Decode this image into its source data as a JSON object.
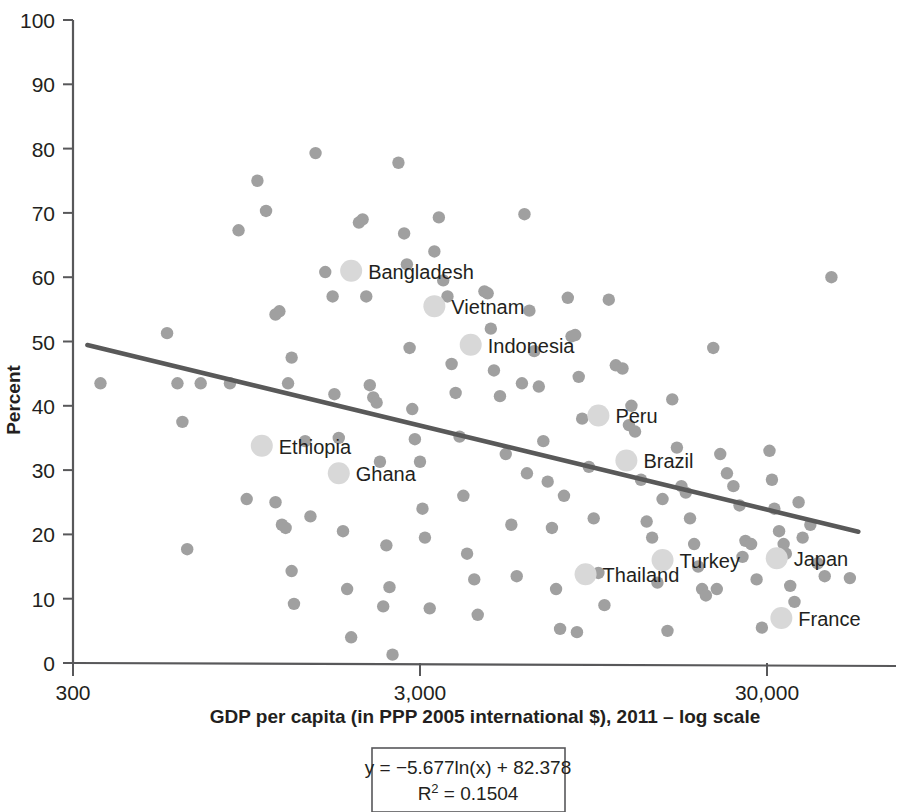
{
  "chart_data": {
    "type": "scatter",
    "title": "",
    "xlabel": "GDP per capita (in PPP 2005 international $), 2011 – log scale",
    "ylabel": "Percent",
    "x_scale": "log",
    "xlim": [
      300,
      60000
    ],
    "ylim": [
      0,
      100
    ],
    "x_ticks": [
      {
        "value": 300,
        "label": "300"
      },
      {
        "value": 3000,
        "label": "3,000"
      },
      {
        "value": 30000,
        "label": "30,000"
      }
    ],
    "y_ticks": [
      {
        "value": 0,
        "label": "0"
      },
      {
        "value": 10,
        "label": "10"
      },
      {
        "value": 20,
        "label": "20"
      },
      {
        "value": 30,
        "label": "30"
      },
      {
        "value": 40,
        "label": "40"
      },
      {
        "value": 50,
        "label": "50"
      },
      {
        "value": 60,
        "label": "60"
      },
      {
        "value": 70,
        "label": "70"
      },
      {
        "value": 80,
        "label": "80"
      },
      {
        "value": 90,
        "label": "90"
      },
      {
        "value": 100,
        "label": "100"
      }
    ],
    "grid": false,
    "legend": "none",
    "marker_color": "#a0a0a0",
    "highlight_marker_color": "#d8d8d8",
    "trendline_color": "#595959",
    "axis_color": "#58585a",
    "trendline": {
      "equation": "y = −5.677ln(x) + 82.378",
      "r_squared_label": "R² = 0.1504",
      "r_squared": 0.1504,
      "slope": -5.677,
      "intercept": 82.378,
      "x_start": 330,
      "x_end": 55000
    },
    "series": [
      {
        "name": "Countries (highlighted)",
        "points": [
          {
            "label": "Bangladesh",
            "x": 1900,
            "y": 61.0
          },
          {
            "label": "Vietnam",
            "x": 3300,
            "y": 55.5
          },
          {
            "label": "Indonesia",
            "x": 4200,
            "y": 49.5
          },
          {
            "label": "Peru",
            "x": 9800,
            "y": 38.5
          },
          {
            "label": "Brazil",
            "x": 11800,
            "y": 31.5
          },
          {
            "label": "Ethiopia",
            "x": 1050,
            "y": 33.8
          },
          {
            "label": "Ghana",
            "x": 1750,
            "y": 29.5
          },
          {
            "label": "Thailand",
            "x": 9000,
            "y": 13.8
          },
          {
            "label": "Turkey",
            "x": 15000,
            "y": 16.0
          },
          {
            "label": "Japan",
            "x": 32000,
            "y": 16.3
          },
          {
            "label": "France",
            "x": 33000,
            "y": 7.0
          }
        ]
      },
      {
        "name": "Other countries",
        "points": [
          {
            "x": 360,
            "y": 43.5
          },
          {
            "x": 560,
            "y": 51.3
          },
          {
            "x": 600,
            "y": 43.5
          },
          {
            "x": 620,
            "y": 37.5
          },
          {
            "x": 640,
            "y": 17.7
          },
          {
            "x": 900,
            "y": 67.3
          },
          {
            "x": 1020,
            "y": 75.0
          },
          {
            "x": 1080,
            "y": 70.3
          },
          {
            "x": 1150,
            "y": 54.2
          },
          {
            "x": 1180,
            "y": 54.7
          },
          {
            "x": 1250,
            "y": 43.5
          },
          {
            "x": 1280,
            "y": 47.5
          },
          {
            "x": 1150,
            "y": 25.0
          },
          {
            "x": 1200,
            "y": 21.5
          },
          {
            "x": 1230,
            "y": 21.0
          },
          {
            "x": 1280,
            "y": 14.3
          },
          {
            "x": 1300,
            "y": 9.2
          },
          {
            "x": 1500,
            "y": 79.3
          },
          {
            "x": 1600,
            "y": 60.8
          },
          {
            "x": 1680,
            "y": 57.0
          },
          {
            "x": 1700,
            "y": 41.8
          },
          {
            "x": 1750,
            "y": 35.0
          },
          {
            "x": 1800,
            "y": 20.5
          },
          {
            "x": 1850,
            "y": 11.5
          },
          {
            "x": 1900,
            "y": 4.0
          },
          {
            "x": 2000,
            "y": 68.5
          },
          {
            "x": 2050,
            "y": 69.0
          },
          {
            "x": 2100,
            "y": 57.0
          },
          {
            "x": 2150,
            "y": 43.2
          },
          {
            "x": 2200,
            "y": 41.3
          },
          {
            "x": 2250,
            "y": 40.5
          },
          {
            "x": 2300,
            "y": 31.3
          },
          {
            "x": 2400,
            "y": 18.3
          },
          {
            "x": 2450,
            "y": 11.8
          },
          {
            "x": 2500,
            "y": 1.3
          },
          {
            "x": 2600,
            "y": 77.8
          },
          {
            "x": 2700,
            "y": 66.8
          },
          {
            "x": 2750,
            "y": 62.0
          },
          {
            "x": 2800,
            "y": 49.0
          },
          {
            "x": 2850,
            "y": 39.5
          },
          {
            "x": 2900,
            "y": 34.8
          },
          {
            "x": 3000,
            "y": 31.3
          },
          {
            "x": 3050,
            "y": 24.0
          },
          {
            "x": 3100,
            "y": 19.5
          },
          {
            "x": 3200,
            "y": 8.5
          },
          {
            "x": 3400,
            "y": 69.3
          },
          {
            "x": 3500,
            "y": 59.5
          },
          {
            "x": 3600,
            "y": 57.0
          },
          {
            "x": 3700,
            "y": 46.5
          },
          {
            "x": 3800,
            "y": 42.0
          },
          {
            "x": 3900,
            "y": 35.2
          },
          {
            "x": 4000,
            "y": 26.0
          },
          {
            "x": 4100,
            "y": 17.0
          },
          {
            "x": 4300,
            "y": 13.0
          },
          {
            "x": 4400,
            "y": 7.5
          },
          {
            "x": 4600,
            "y": 57.8
          },
          {
            "x": 4700,
            "y": 57.5
          },
          {
            "x": 4800,
            "y": 52.0
          },
          {
            "x": 4900,
            "y": 45.5
          },
          {
            "x": 5100,
            "y": 41.5
          },
          {
            "x": 5300,
            "y": 32.5
          },
          {
            "x": 5500,
            "y": 21.5
          },
          {
            "x": 5700,
            "y": 13.5
          },
          {
            "x": 6000,
            "y": 69.8
          },
          {
            "x": 6200,
            "y": 54.8
          },
          {
            "x": 6400,
            "y": 48.5
          },
          {
            "x": 6600,
            "y": 43.0
          },
          {
            "x": 6800,
            "y": 34.5
          },
          {
            "x": 7000,
            "y": 28.2
          },
          {
            "x": 7200,
            "y": 21.0
          },
          {
            "x": 7400,
            "y": 11.5
          },
          {
            "x": 7600,
            "y": 5.3
          },
          {
            "x": 8000,
            "y": 56.8
          },
          {
            "x": 8200,
            "y": 50.8
          },
          {
            "x": 8400,
            "y": 51.0
          },
          {
            "x": 8600,
            "y": 44.5
          },
          {
            "x": 8800,
            "y": 38.0
          },
          {
            "x": 9200,
            "y": 30.5
          },
          {
            "x": 9500,
            "y": 22.5
          },
          {
            "x": 9800,
            "y": 14.0
          },
          {
            "x": 10200,
            "y": 9.0
          },
          {
            "x": 10500,
            "y": 56.5
          },
          {
            "x": 11000,
            "y": 46.3
          },
          {
            "x": 11500,
            "y": 45.8
          },
          {
            "x": 12000,
            "y": 37.0
          },
          {
            "x": 12500,
            "y": 36.0
          },
          {
            "x": 13000,
            "y": 28.5
          },
          {
            "x": 13500,
            "y": 22.0
          },
          {
            "x": 14000,
            "y": 19.5
          },
          {
            "x": 14500,
            "y": 12.5
          },
          {
            "x": 15500,
            "y": 5.0
          },
          {
            "x": 16000,
            "y": 41.0
          },
          {
            "x": 16500,
            "y": 33.5
          },
          {
            "x": 17000,
            "y": 27.5
          },
          {
            "x": 17500,
            "y": 26.5
          },
          {
            "x": 18000,
            "y": 22.5
          },
          {
            "x": 18500,
            "y": 18.5
          },
          {
            "x": 19000,
            "y": 15.0
          },
          {
            "x": 19500,
            "y": 11.5
          },
          {
            "x": 20000,
            "y": 10.5
          },
          {
            "x": 21000,
            "y": 49.0
          },
          {
            "x": 22000,
            "y": 32.5
          },
          {
            "x": 23000,
            "y": 29.5
          },
          {
            "x": 24000,
            "y": 27.5
          },
          {
            "x": 25000,
            "y": 24.5
          },
          {
            "x": 26000,
            "y": 19.0
          },
          {
            "x": 27000,
            "y": 18.5
          },
          {
            "x": 28000,
            "y": 13.0
          },
          {
            "x": 29000,
            "y": 5.5
          },
          {
            "x": 30500,
            "y": 33.0
          },
          {
            "x": 31000,
            "y": 28.5
          },
          {
            "x": 31500,
            "y": 24.0
          },
          {
            "x": 32500,
            "y": 20.5
          },
          {
            "x": 33500,
            "y": 18.5
          },
          {
            "x": 34000,
            "y": 17.0
          },
          {
            "x": 35000,
            "y": 12.0
          },
          {
            "x": 36000,
            "y": 9.5
          },
          {
            "x": 37000,
            "y": 25.0
          },
          {
            "x": 38000,
            "y": 19.5
          },
          {
            "x": 40000,
            "y": 21.5
          },
          {
            "x": 42000,
            "y": 15.5
          },
          {
            "x": 44000,
            "y": 13.5
          },
          {
            "x": 46000,
            "y": 60.0
          },
          {
            "x": 52000,
            "y": 13.2
          },
          {
            "x": 700,
            "y": 43.5
          },
          {
            "x": 850,
            "y": 43.5
          },
          {
            "x": 950,
            "y": 25.5
          },
          {
            "x": 1400,
            "y": 34.5
          },
          {
            "x": 1450,
            "y": 22.8
          },
          {
            "x": 2350,
            "y": 8.8
          },
          {
            "x": 3300,
            "y": 64.0
          },
          {
            "x": 5900,
            "y": 43.5
          },
          {
            "x": 6100,
            "y": 29.5
          },
          {
            "x": 7800,
            "y": 26.0
          },
          {
            "x": 8500,
            "y": 4.8
          },
          {
            "x": 12200,
            "y": 40.0
          },
          {
            "x": 15000,
            "y": 25.5
          },
          {
            "x": 21500,
            "y": 11.5
          },
          {
            "x": 25500,
            "y": 16.5
          }
        ]
      }
    ]
  },
  "axis": {
    "y_title": "Percent",
    "x_title": "GDP per capita (in PPP 2005 international $), 2011 – log scale"
  },
  "equation_box": {
    "line1": "y = −5.677ln(x) + 82.378",
    "line2_prefix": "R",
    "line2_sup": "2",
    "line2_rest": " = 0.1504"
  }
}
